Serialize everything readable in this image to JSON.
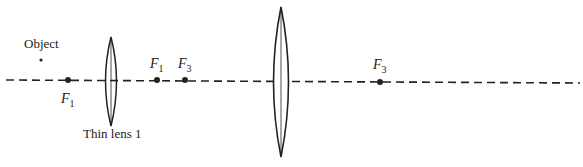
{
  "diagram": {
    "type": "optics-two-thin-lens-system",
    "axis": {
      "style": "dashed",
      "color": "#222222"
    },
    "object": {
      "label": "Object"
    },
    "lens1": {
      "label": "Thin lens 1"
    },
    "lens2": {
      "label": ""
    },
    "focal_points": [
      {
        "id": "f1-left",
        "symbol": "F",
        "subscript": "1"
      },
      {
        "id": "f1-right",
        "symbol": "F",
        "subscript": "1"
      },
      {
        "id": "f3-left",
        "symbol": "F",
        "subscript": "3"
      },
      {
        "id": "f3-right",
        "symbol": "F",
        "subscript": "3"
      }
    ]
  }
}
